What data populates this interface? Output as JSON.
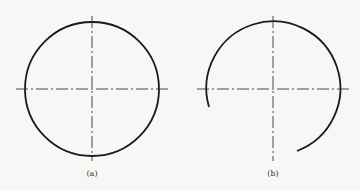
{
  "figure": {
    "panels": [
      {
        "id": "a",
        "label": "(a)",
        "shape": "full-circle",
        "center": [
          92,
          89
        ],
        "radius": 67,
        "centerlines": {
          "h": [
            16,
            168
          ],
          "v": [
            16,
            161
          ]
        }
      },
      {
        "id": "b",
        "label": "(b)",
        "shape": "open-arc",
        "center": [
          273,
          89
        ],
        "radius": 67,
        "arc_start": [
          209,
          107
        ],
        "arc_end": [
          297,
          151
        ],
        "centerlines": {
          "h": [
            197,
            349
          ],
          "v": [
            16,
            161
          ]
        }
      }
    ],
    "colors": {
      "stroke": "#1a1a1a",
      "centerline": "#333333",
      "background": "#f7f7f5"
    }
  }
}
